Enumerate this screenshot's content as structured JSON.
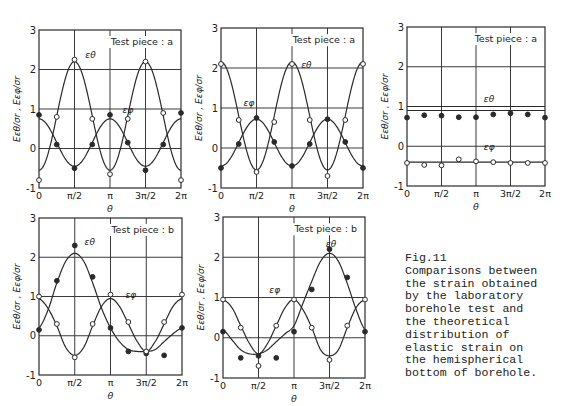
{
  "figure": {
    "caption_lines": [
      "Fig.11",
      "Comparisons between",
      "the strain obtained",
      "by the laboratory",
      "borehole test and",
      "the theoretical",
      "distribution of",
      "elastic strain on",
      "the hemispherical",
      "bottom of borehole."
    ]
  },
  "axes_common": {
    "ylabel": "Eεθ/σr , Eεφ/σr",
    "xlabel": "θ",
    "x_ticks": [
      "0",
      "π/2",
      "π",
      "3π/2",
      "2π"
    ],
    "y_ticks": [
      "-1",
      "0",
      "1",
      "2",
      "3"
    ]
  },
  "chart_data": [
    {
      "id": "panel-1",
      "type": "line",
      "title": "Test piece : a",
      "xlabel": "θ",
      "ylabel": "Eεθ/σr , Eεφ/σr",
      "x_ticks": [
        "0",
        "π/2",
        "π",
        "3π/2",
        "2π"
      ],
      "xlim": [
        0,
        6.2832
      ],
      "ylim": [
        -1,
        3
      ],
      "grid": true,
      "series": [
        {
          "name": "εθ",
          "kind": "theory",
          "formula": {
            "a": 0.825,
            "b": -1.375
          },
          "label_at": [
            2.05,
            2.3
          ]
        },
        {
          "name": "εφ",
          "kind": "theory",
          "formula": {
            "a": 0.15,
            "b": 0.6
          },
          "label_at": [
            3.7,
            0.9
          ]
        },
        {
          "name": "εθ measured",
          "marker": "open",
          "x": [
            0,
            0.785,
            1.571,
            2.356,
            3.142,
            3.927,
            4.712,
            5.498,
            6.283
          ],
          "y": [
            -0.8,
            0.8,
            2.25,
            0.75,
            -0.65,
            0.75,
            2.2,
            0.9,
            -0.8
          ]
        },
        {
          "name": "εφ measured",
          "marker": "filled",
          "x": [
            0,
            0.785,
            1.571,
            2.356,
            3.142,
            3.927,
            4.712,
            5.498,
            6.283
          ],
          "y": [
            0.85,
            0.1,
            -0.5,
            0.1,
            0.85,
            0.15,
            -0.55,
            0.1,
            0.9
          ]
        }
      ]
    },
    {
      "id": "panel-2",
      "type": "line",
      "title": "Test piece : a",
      "xlabel": "θ",
      "ylabel": "Eεθ/σr , Eεφ/σr",
      "x_ticks": [
        "0",
        "π/2",
        "π",
        "3π/2",
        "2π"
      ],
      "xlim": [
        0,
        6.2832
      ],
      "ylim": [
        -1,
        3
      ],
      "grid": true,
      "series": [
        {
          "name": "εθ",
          "kind": "theory",
          "formula": {
            "a": 0.8,
            "b": 1.35
          },
          "label_at": [
            3.55,
            2.0
          ]
        },
        {
          "name": "εφ",
          "kind": "theory",
          "formula": {
            "a": 0.135,
            "b": -0.585
          },
          "label_at": [
            1.0,
            1.05
          ]
        },
        {
          "name": "εθ measured",
          "marker": "open",
          "x": [
            0,
            0.785,
            1.571,
            2.356,
            3.142,
            3.927,
            4.712,
            5.498,
            6.283
          ],
          "y": [
            2.1,
            0.7,
            -0.6,
            0.65,
            2.1,
            0.7,
            -0.7,
            0.7,
            2.1
          ]
        },
        {
          "name": "εφ measured",
          "marker": "filled",
          "x": [
            0,
            0.785,
            1.571,
            2.356,
            3.142,
            3.927,
            4.712,
            5.498,
            6.283
          ],
          "y": [
            -0.5,
            0.1,
            0.75,
            0.15,
            -0.45,
            0.1,
            0.72,
            0.15,
            -0.5
          ]
        }
      ]
    },
    {
      "id": "panel-3",
      "type": "line",
      "title": "Test piece : a",
      "xlabel": "θ",
      "ylabel": "Eεθ/σr , Eεφ/σr",
      "x_ticks": [
        "0",
        "π/2",
        "π",
        "3π/2",
        "2π"
      ],
      "xlim": [
        0,
        6.2832
      ],
      "ylim": [
        -1,
        3
      ],
      "grid": true,
      "series": [
        {
          "name": "εθ",
          "kind": "constant",
          "value": 0.9,
          "label_at": [
            3.5,
            1.12
          ]
        },
        {
          "name": "εφ",
          "kind": "constant",
          "value": -0.4,
          "label_at": [
            3.5,
            -0.1
          ]
        },
        {
          "name": "εθ measured",
          "marker": "filled",
          "x": [
            0,
            0.785,
            1.571,
            2.356,
            3.142,
            3.927,
            4.712,
            5.498,
            6.283
          ],
          "y": [
            0.72,
            0.78,
            0.77,
            0.73,
            0.73,
            0.8,
            0.83,
            0.8,
            0.72
          ]
        },
        {
          "name": "εφ measured",
          "marker": "open",
          "x": [
            0,
            0.785,
            1.571,
            2.356,
            3.142,
            3.927,
            4.712,
            5.498,
            6.283
          ],
          "y": [
            -0.42,
            -0.47,
            -0.48,
            -0.33,
            -0.38,
            -0.4,
            -0.42,
            -0.42,
            -0.42
          ]
        }
      ]
    },
    {
      "id": "panel-4",
      "type": "line",
      "title": "Test piece : b",
      "xlabel": "θ",
      "ylabel": "Eεθ/σr , Eεφ/σr",
      "x_ticks": [
        "0",
        "π/2",
        "π",
        "3π/2",
        "2π"
      ],
      "xlim": [
        0,
        6.2832
      ],
      "ylim": [
        -1,
        3
      ],
      "grid": true,
      "series": [
        {
          "name": "εθ",
          "kind": "curve",
          "x": [
            0,
            0.393,
            0.785,
            1.178,
            1.571,
            1.963,
            2.356,
            2.749,
            3.142,
            3.534,
            3.927,
            4.32,
            4.712,
            5.105,
            5.498,
            5.89,
            6.283
          ],
          "y": [
            0.2,
            0.65,
            1.35,
            1.9,
            2.1,
            1.9,
            1.35,
            0.7,
            0.2,
            -0.15,
            -0.35,
            -0.4,
            -0.4,
            -0.35,
            -0.15,
            0.05,
            0.2
          ],
          "label_at": [
            2.0,
            2.3
          ]
        },
        {
          "name": "εφ",
          "kind": "curve",
          "x": [
            0,
            0.393,
            0.785,
            1.178,
            1.571,
            1.963,
            2.356,
            2.749,
            3.142,
            3.534,
            3.927,
            4.32,
            4.712,
            5.105,
            5.498,
            5.89,
            6.283
          ],
          "y": [
            0.95,
            0.7,
            0.25,
            -0.3,
            -0.5,
            -0.3,
            0.25,
            0.75,
            0.95,
            0.75,
            0.3,
            -0.15,
            -0.4,
            -0.15,
            0.3,
            0.75,
            0.95
          ],
          "label_at": [
            3.8,
            0.95
          ]
        },
        {
          "name": "εθ measured",
          "marker": "filled",
          "x": [
            0,
            0.785,
            1.571,
            2.356,
            3.142,
            3.927,
            4.712,
            5.498,
            6.283
          ],
          "y": [
            0.15,
            1.4,
            2.3,
            1.5,
            0.2,
            -0.4,
            -0.45,
            -0.5,
            0.2
          ]
        },
        {
          "name": "εφ measured",
          "marker": "open",
          "x": [
            0,
            0.785,
            1.571,
            2.356,
            3.142,
            3.927,
            4.712,
            5.498,
            6.283
          ],
          "y": [
            1.0,
            0.3,
            -0.55,
            0.3,
            1.05,
            0.35,
            -0.4,
            0.35,
            1.05
          ]
        }
      ]
    },
    {
      "id": "panel-5",
      "type": "line",
      "title": "Test piece : b",
      "xlabel": "θ",
      "ylabel": "Eεθ/σr , Eεφ/σr",
      "x_ticks": [
        "0",
        "π/2",
        "π",
        "3π/2",
        "2π"
      ],
      "xlim": [
        0,
        6.2832
      ],
      "ylim": [
        -1,
        3
      ],
      "grid": true,
      "series": [
        {
          "name": "εθ",
          "kind": "curve",
          "x": [
            0,
            0.393,
            0.785,
            1.178,
            1.571,
            1.963,
            2.356,
            2.749,
            3.142,
            3.534,
            3.927,
            4.32,
            4.712,
            5.105,
            5.498,
            5.89,
            6.283
          ],
          "y": [
            0.2,
            -0.05,
            -0.3,
            -0.4,
            -0.4,
            -0.3,
            -0.1,
            0.1,
            0.3,
            0.85,
            1.4,
            1.9,
            2.1,
            1.9,
            1.35,
            0.7,
            0.2
          ],
          "label_at": [
            4.55,
            2.25
          ]
        },
        {
          "name": "εφ",
          "kind": "curve",
          "x": [
            0,
            0.393,
            0.785,
            1.178,
            1.571,
            1.963,
            2.356,
            2.749,
            3.142,
            3.534,
            3.927,
            4.32,
            4.712,
            5.105,
            5.498,
            5.89,
            6.283
          ],
          "y": [
            0.95,
            0.75,
            0.3,
            -0.15,
            -0.4,
            -0.15,
            0.3,
            0.75,
            0.95,
            0.7,
            0.25,
            -0.3,
            -0.45,
            -0.3,
            0.25,
            0.75,
            0.95
          ],
          "label_at": [
            2.05,
            1.1
          ]
        },
        {
          "name": "εθ measured",
          "marker": "filled",
          "x": [
            0,
            0.785,
            1.571,
            2.356,
            3.142,
            3.927,
            4.712,
            5.498,
            6.283
          ],
          "y": [
            0.15,
            -0.5,
            -0.45,
            -0.5,
            0.15,
            1.2,
            2.2,
            1.5,
            0.15
          ]
        },
        {
          "name": "εφ measured",
          "marker": "open",
          "x": [
            0,
            0.785,
            1.571,
            2.356,
            3.142,
            3.927,
            4.712,
            5.498,
            6.283
          ],
          "y": [
            0.95,
            0.25,
            -0.7,
            0.3,
            0.95,
            0.25,
            -0.55,
            0.3,
            0.95
          ]
        }
      ]
    }
  ],
  "layout": {
    "panels": [
      {
        "x0": 39,
        "y0": 30,
        "x1": 181,
        "y1": 188
      },
      {
        "x0": 221,
        "y0": 28,
        "x1": 363,
        "y1": 188
      },
      {
        "x0": 407,
        "y0": 27,
        "x1": 545,
        "y1": 186
      },
      {
        "x0": 39,
        "y0": 218,
        "x1": 182,
        "y1": 375
      },
      {
        "x0": 223,
        "y0": 217,
        "x1": 365,
        "y1": 378
      }
    ],
    "ink": "#2a2a2a",
    "grid_color": "#3a3a3a"
  }
}
